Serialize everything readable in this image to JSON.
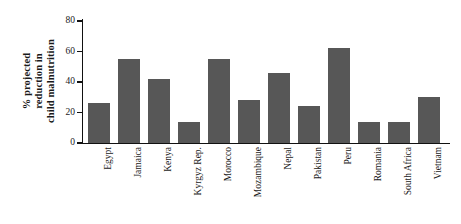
{
  "chart_data": {
    "type": "bar",
    "title": "",
    "subtitle": "",
    "xlabel": "",
    "ylabel": "% projected reduction in child malnutrition",
    "ylabel_lines": [
      "% projected",
      "reduction in",
      "child malnutrition"
    ],
    "categories": [
      "Egypt",
      "Jamaica",
      "Kenya",
      "Kyrgyz Rep.",
      "Morocco",
      "Mozambique",
      "Nepal",
      "Pakistan",
      "Peru",
      "Romania",
      "South Africa",
      "Vietnam"
    ],
    "values": [
      26,
      55,
      42,
      14,
      55,
      28,
      46,
      24,
      62,
      14,
      14,
      30
    ],
    "ylim": [
      0,
      80
    ],
    "yticks": [
      0,
      20,
      40,
      60,
      80
    ],
    "ytick_labels": [
      "0",
      "20",
      "40",
      "60",
      "80"
    ],
    "grid": false,
    "legend": false,
    "bar_color": "#575757",
    "axis_color": "#111111",
    "background_color": "#ffffff"
  }
}
